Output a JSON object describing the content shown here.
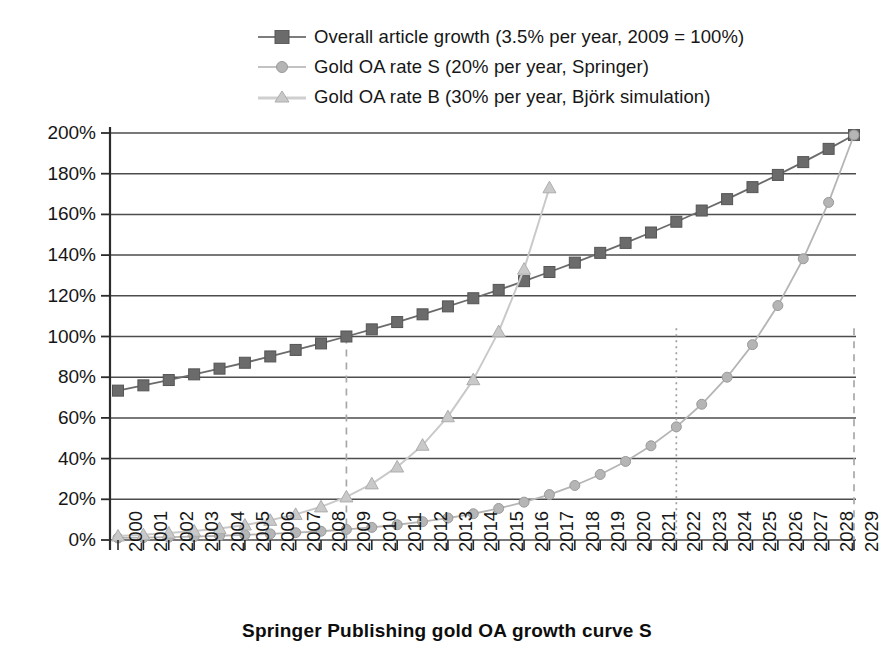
{
  "caption": "Springer Publishing gold OA growth curve S",
  "legend": [
    {
      "label": "Overall article growth (3.5% per year, 2009 = 100%)",
      "marker": "square-marker-icon",
      "color": "#6b6b6b"
    },
    {
      "label": "Gold OA rate S (20% per year, Springer)",
      "marker": "circle-marker-icon",
      "color": "#b5b5b5"
    },
    {
      "label": "Gold OA rate B (30% per year, Björk simulation)",
      "marker": "triangle-marker-icon",
      "color": "#c9c9c9"
    }
  ],
  "axes": {
    "y_ticks": [
      "0%",
      "20%",
      "40%",
      "60%",
      "80%",
      "100%",
      "120%",
      "140%",
      "160%",
      "180%",
      "200%"
    ],
    "x_ticks": [
      "2000",
      "2001",
      "2002",
      "2003",
      "2004",
      "2005",
      "2006",
      "2007",
      "2008",
      "2009",
      "2010",
      "2011",
      "2012",
      "2013",
      "2014",
      "2015",
      "2016",
      "2017",
      "2018",
      "2019",
      "2020",
      "2021",
      "2022",
      "2023",
      "2024",
      "2025",
      "2026",
      "2027",
      "2028",
      "2029"
    ]
  },
  "chart_data": {
    "type": "line",
    "title": "Springer Publishing gold OA growth curve S",
    "xlabel": "",
    "ylabel": "",
    "ylim": [
      0,
      200
    ],
    "xlim": [
      "2000",
      "2029"
    ],
    "grid": "horizontal",
    "legend_position": "top-center",
    "categories": [
      "2000",
      "2001",
      "2002",
      "2003",
      "2004",
      "2005",
      "2006",
      "2007",
      "2008",
      "2009",
      "2010",
      "2011",
      "2012",
      "2013",
      "2014",
      "2015",
      "2016",
      "2017",
      "2018",
      "2019",
      "2020",
      "2021",
      "2022",
      "2023",
      "2024",
      "2025",
      "2026",
      "2027",
      "2028",
      "2029"
    ],
    "series": [
      {
        "name": "Overall article growth (3.5% per year, 2009 = 100%)",
        "marker": "square",
        "color": "#6b6b6b",
        "values": [
          73.4,
          76.0,
          78.6,
          81.4,
          84.2,
          87.1,
          90.2,
          93.4,
          96.6,
          100.0,
          103.5,
          107.1,
          110.9,
          114.8,
          118.8,
          122.9,
          127.2,
          131.7,
          136.3,
          141.1,
          146.0,
          151.1,
          156.4,
          161.9,
          167.5,
          173.4,
          179.4,
          185.7,
          192.2,
          199.0
        ]
      },
      {
        "name": "Gold OA rate S (20% per year, Springer)",
        "marker": "circle",
        "color": "#b5b5b5",
        "values": [
          1.0,
          1.2,
          1.4,
          1.7,
          2.1,
          2.5,
          3.0,
          3.6,
          4.3,
          5.2,
          6.2,
          7.5,
          9.0,
          10.8,
          12.9,
          15.5,
          18.6,
          22.3,
          26.8,
          32.2,
          38.6,
          46.3,
          55.6,
          66.7,
          80.0,
          96.0,
          115.2,
          138.2,
          165.9,
          199.0
        ]
      },
      {
        "name": "Gold OA rate B (30% per year, Björk simulation)",
        "marker": "triangle",
        "color": "#c9c9c9",
        "values": [
          2.0,
          2.6,
          3.4,
          4.4,
          5.7,
          7.4,
          9.7,
          12.6,
          16.3,
          21.2,
          27.6,
          35.9,
          46.6,
          60.6,
          78.8,
          102.4,
          133.1,
          173.1,
          225.0,
          292.5,
          380.2,
          494.2,
          642.5,
          null,
          null,
          null,
          null,
          null,
          null,
          null
        ]
      }
    ],
    "annotations": [
      {
        "name": "marker-2009",
        "type": "vertical-dashed-line",
        "x": "2009",
        "y_top": 100
      },
      {
        "name": "marker-2022",
        "type": "vertical-dotted-line",
        "x": "2022",
        "y_top": 104
      },
      {
        "name": "marker-2029",
        "type": "vertical-dashed-line",
        "x": "2029",
        "y_top": 104
      }
    ]
  }
}
